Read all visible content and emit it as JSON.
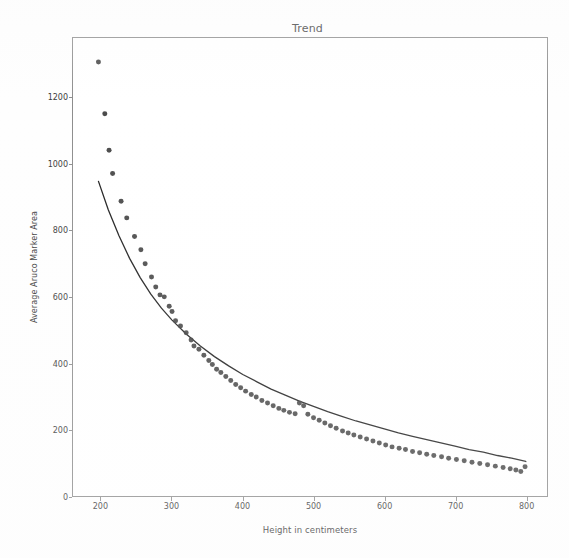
{
  "figure": {
    "background_color": "#fefefe",
    "axes_frame_color": "#8d8d8d",
    "width": 569,
    "height": 558
  },
  "chart_data": {
    "type": "scatter",
    "title": "Trend",
    "xlabel": "Height in centimeters",
    "ylabel": "Average Aruco Marker Area",
    "xlim": [
      160,
      830
    ],
    "ylim": [
      0,
      1380
    ],
    "xticks": [
      200,
      300,
      400,
      500,
      600,
      700,
      800
    ],
    "yticks": [
      0,
      200,
      400,
      600,
      800,
      1000,
      1200
    ],
    "grid": false,
    "legend": null,
    "marker_color": "#3b3b3b",
    "marker_size": 5,
    "fit_line_color": "#1f1f1f",
    "series": [
      {
        "name": "Average Aruco Marker Area",
        "kind": "scatter",
        "points": [
          [
            196,
            1308
          ],
          [
            205,
            1152
          ],
          [
            211,
            1042
          ],
          [
            216,
            972
          ],
          [
            228,
            888
          ],
          [
            236,
            838
          ],
          [
            247,
            782
          ],
          [
            256,
            742
          ],
          [
            262,
            700
          ],
          [
            271,
            660
          ],
          [
            277,
            630
          ],
          [
            283,
            606
          ],
          [
            289,
            600
          ],
          [
            296,
            572
          ],
          [
            300,
            556
          ],
          [
            305,
            528
          ],
          [
            312,
            512
          ],
          [
            320,
            492
          ],
          [
            327,
            470
          ],
          [
            331,
            452
          ],
          [
            338,
            442
          ],
          [
            345,
            424
          ],
          [
            352,
            408
          ],
          [
            357,
            396
          ],
          [
            363,
            382
          ],
          [
            369,
            372
          ],
          [
            376,
            360
          ],
          [
            383,
            348
          ],
          [
            390,
            336
          ],
          [
            397,
            326
          ],
          [
            404,
            316
          ],
          [
            412,
            306
          ],
          [
            419,
            298
          ],
          [
            427,
            288
          ],
          [
            435,
            280
          ],
          [
            443,
            272
          ],
          [
            451,
            264
          ],
          [
            458,
            258
          ],
          [
            466,
            252
          ],
          [
            474,
            248
          ],
          [
            480,
            280
          ],
          [
            486,
            272
          ],
          [
            492,
            246
          ],
          [
            500,
            236
          ],
          [
            508,
            228
          ],
          [
            516,
            220
          ],
          [
            524,
            212
          ],
          [
            532,
            204
          ],
          [
            541,
            196
          ],
          [
            549,
            190
          ],
          [
            557,
            184
          ],
          [
            566,
            178
          ],
          [
            575,
            172
          ],
          [
            584,
            166
          ],
          [
            593,
            160
          ],
          [
            602,
            154
          ],
          [
            611,
            148
          ],
          [
            621,
            144
          ],
          [
            630,
            140
          ],
          [
            640,
            134
          ],
          [
            650,
            130
          ],
          [
            660,
            126
          ],
          [
            670,
            122
          ],
          [
            681,
            118
          ],
          [
            691,
            114
          ],
          [
            702,
            110
          ],
          [
            713,
            106
          ],
          [
            724,
            102
          ],
          [
            735,
            98
          ],
          [
            746,
            94
          ],
          [
            757,
            90
          ],
          [
            768,
            86
          ],
          [
            778,
            82
          ],
          [
            786,
            78
          ],
          [
            793,
            74
          ],
          [
            799,
            88
          ]
        ]
      },
      {
        "name": "Fitted trend curve",
        "kind": "line",
        "points": [
          [
            196,
            948
          ],
          [
            210,
            862
          ],
          [
            225,
            784
          ],
          [
            240,
            716
          ],
          [
            255,
            658
          ],
          [
            270,
            608
          ],
          [
            285,
            566
          ],
          [
            300,
            530
          ],
          [
            320,
            488
          ],
          [
            340,
            452
          ],
          [
            360,
            420
          ],
          [
            380,
            392
          ],
          [
            400,
            366
          ],
          [
            420,
            344
          ],
          [
            440,
            322
          ],
          [
            460,
            304
          ],
          [
            480,
            286
          ],
          [
            500,
            270
          ],
          [
            520,
            254
          ],
          [
            540,
            240
          ],
          [
            560,
            226
          ],
          [
            580,
            214
          ],
          [
            600,
            202
          ],
          [
            620,
            190
          ],
          [
            640,
            180
          ],
          [
            660,
            170
          ],
          [
            680,
            160
          ],
          [
            700,
            150
          ],
          [
            720,
            140
          ],
          [
            740,
            132
          ],
          [
            760,
            122
          ],
          [
            780,
            114
          ],
          [
            800,
            104
          ]
        ]
      }
    ]
  }
}
